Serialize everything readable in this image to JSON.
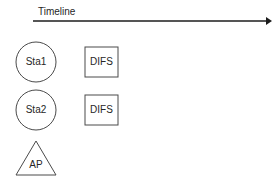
{
  "diagram": {
    "title": "Timeline",
    "background_color": "#ffffff",
    "stroke_color": "#4a4a4a",
    "axis_color": "#1c1c1c",
    "text_color": "#262626",
    "timeline": {
      "label": "Timeline",
      "arrow_direction": "right",
      "start_x": 33,
      "end_x": 271,
      "y": 21
    },
    "nodes": [
      {
        "label": "Sta1",
        "shape": "circle",
        "cx": 36,
        "cy": 62,
        "r": 20,
        "icon": "station-circle-icon"
      },
      {
        "label": "Sta2",
        "shape": "circle",
        "cx": 36,
        "cy": 110,
        "r": 20,
        "icon": "station-circle-icon"
      },
      {
        "label": "AP",
        "shape": "triangle",
        "cx": 36,
        "apex_y": 141,
        "base_y": 175,
        "half_width": 20,
        "icon": "access-point-triangle-icon"
      }
    ],
    "frames": [
      {
        "label": "DIFS",
        "row": "Sta1",
        "x": 85,
        "y": 47,
        "width": 33,
        "height": 30
      },
      {
        "label": "DIFS",
        "row": "Sta2",
        "x": 85,
        "y": 95,
        "width": 33,
        "height": 30
      }
    ]
  }
}
